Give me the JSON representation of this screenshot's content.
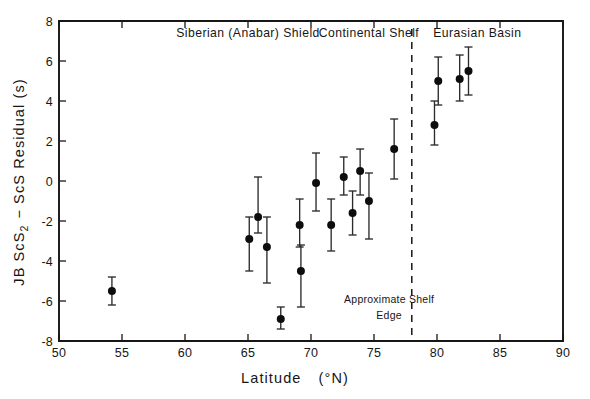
{
  "figure": {
    "background_color": "#ffffff",
    "ink_color": "#161616",
    "marker_color": "#0d0d0d"
  },
  "axes": {
    "x_title_main": "Latitude",
    "x_title_units": "(°N)",
    "y_title": "JB ScS₂ − ScS Residual (s)",
    "y_title_parts": {
      "prefix": "JB ScS",
      "subscript": "2",
      "suffix": "− ScS Residual (s)"
    },
    "x_ticks": [
      "50",
      "55",
      "60",
      "65",
      "70",
      "75",
      "80",
      "85",
      "90"
    ],
    "y_ticks": [
      "8",
      "6",
      "4",
      "2",
      "0",
      "-2",
      "-4",
      "-6",
      "-8"
    ],
    "xlim": [
      50,
      90
    ],
    "ylim": [
      -8,
      8
    ],
    "grid": "off"
  },
  "annotations": {
    "regions": [
      {
        "name": "region-label-siberian-shield",
        "text": "Siberian (Anabar) Shield",
        "x_center": 65.0,
        "y_value": 7.2
      },
      {
        "name": "region-label-continental-shelf",
        "text": "Continental Shelf",
        "x_center": 74.6,
        "y_value": 7.2
      },
      {
        "name": "region-label-eurasian-basin",
        "text": "Eurasian Basin",
        "x_center": 83.2,
        "y_value": 7.2
      }
    ],
    "shelf_edge": {
      "line_x": 78.0,
      "line_y_top": 7.6,
      "line_y_bottom": -8.0,
      "label_line1": "Approximate Shelf",
      "label_line2": "Edge",
      "label_x": 76.2,
      "label_y1": -6.1,
      "label_y2": -6.9
    }
  },
  "chart_data": {
    "type": "scatter",
    "title": "",
    "xlabel": "Latitude (°N)",
    "ylabel": "JB ScS₂ − ScS Residual (s)",
    "xlim": [
      50,
      90
    ],
    "ylim": [
      -8,
      8
    ],
    "grid": false,
    "legend": "none",
    "error_bars": "vertical, symmetric-ish with caps",
    "points": [
      {
        "latitude": 54.2,
        "residual": -5.5,
        "err_low": -6.2,
        "err_high": -4.8
      },
      {
        "latitude": 65.1,
        "residual": -2.9,
        "err_low": -4.5,
        "err_high": -1.8
      },
      {
        "latitude": 65.8,
        "residual": -1.8,
        "err_low": -2.6,
        "err_high": 0.2
      },
      {
        "latitude": 66.5,
        "residual": -3.3,
        "err_low": -5.1,
        "err_high": -1.8
      },
      {
        "latitude": 67.6,
        "residual": -6.9,
        "err_low": -7.4,
        "err_high": -6.3
      },
      {
        "latitude": 69.1,
        "residual": -2.2,
        "err_low": -3.3,
        "err_high": -0.9
      },
      {
        "latitude": 69.2,
        "residual": -4.5,
        "err_low": -6.3,
        "err_high": -3.2
      },
      {
        "latitude": 70.4,
        "residual": -0.1,
        "err_low": -1.5,
        "err_high": 1.4
      },
      {
        "latitude": 71.6,
        "residual": -2.2,
        "err_low": -3.5,
        "err_high": -0.9
      },
      {
        "latitude": 72.6,
        "residual": 0.2,
        "err_low": -0.7,
        "err_high": 1.2
      },
      {
        "latitude": 73.3,
        "residual": -1.6,
        "err_low": -2.7,
        "err_high": -0.5
      },
      {
        "latitude": 73.9,
        "residual": 0.5,
        "err_low": -0.7,
        "err_high": 1.6
      },
      {
        "latitude": 74.6,
        "residual": -1.0,
        "err_low": -2.9,
        "err_high": 0.4
      },
      {
        "latitude": 76.6,
        "residual": 1.6,
        "err_low": 0.1,
        "err_high": 3.1
      },
      {
        "latitude": 79.8,
        "residual": 2.8,
        "err_low": 1.8,
        "err_high": 4.0
      },
      {
        "latitude": 80.1,
        "residual": 5.0,
        "err_low": 3.8,
        "err_high": 6.2
      },
      {
        "latitude": 81.8,
        "residual": 5.1,
        "err_low": 4.0,
        "err_high": 6.3
      },
      {
        "latitude": 82.5,
        "residual": 5.5,
        "err_low": 4.3,
        "err_high": 6.7
      }
    ]
  }
}
